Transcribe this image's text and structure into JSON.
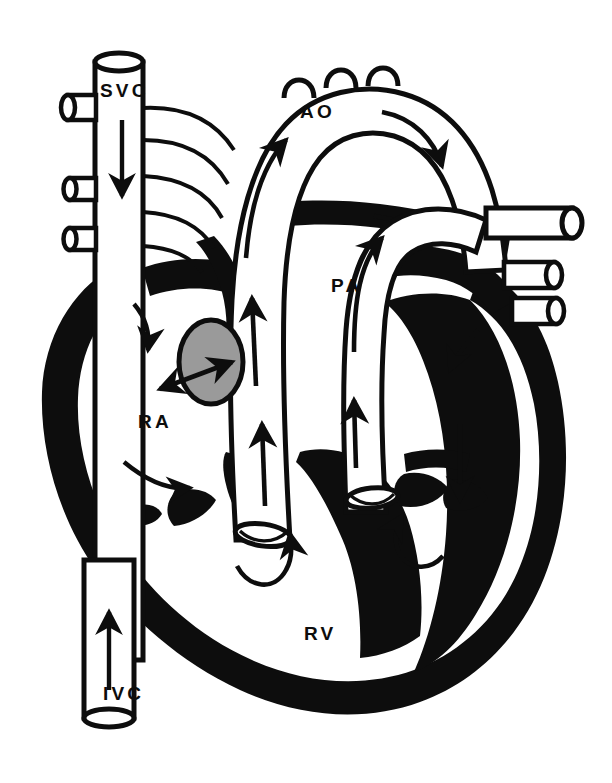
{
  "figure": {
    "kind": "anatomical-line-diagram",
    "background_color": "#ffffff",
    "ink_color": "#0d0d0d",
    "accent_gray": "#9a9a9a",
    "width": 612,
    "height": 783
  },
  "labels": {
    "svc": "SVC",
    "ivc": "IVC",
    "ao": "AO",
    "pa": "PA",
    "ra": "RA",
    "rv": "RV",
    "la": "LA",
    "lv": "LV"
  },
  "label_positions": {
    "svc": {
      "x": 100,
      "y": 97
    },
    "ivc": {
      "x": 103,
      "y": 700
    },
    "ao": {
      "x": 300,
      "y": 118
    },
    "pa": {
      "x": 331,
      "y": 292
    },
    "ra": {
      "x": 138,
      "y": 428
    },
    "rv": {
      "x": 304,
      "y": 640
    },
    "la": {
      "x": 469,
      "y": 400
    },
    "lv": {
      "x": 466,
      "y": 590
    }
  },
  "structures": [
    {
      "id": "svc",
      "name": "superior-vena-cava",
      "label": "SVC",
      "flow": "down"
    },
    {
      "id": "ivc",
      "name": "inferior-vena-cava",
      "label": "IVC",
      "flow": "up"
    },
    {
      "id": "ao",
      "name": "aorta",
      "label": "AO",
      "flow": "arch-right"
    },
    {
      "id": "pa",
      "name": "pulmonary-artery",
      "label": "PA",
      "flow": "up"
    },
    {
      "id": "ra",
      "name": "right-atrium",
      "label": "RA",
      "flow": "swirl"
    },
    {
      "id": "rv",
      "name": "right-ventricle",
      "label": "RV",
      "flow": "up-out"
    },
    {
      "id": "la",
      "name": "left-atrium",
      "label": "LA",
      "flow": "down-in"
    },
    {
      "id": "lv",
      "name": "left-ventricle",
      "label": "LV",
      "flow": "up-out"
    },
    {
      "id": "foramen-ovale",
      "name": "foramen-ovale",
      "label": "",
      "flow": "bidirectional"
    }
  ],
  "vessel_stubs": {
    "svc_tributaries": 3,
    "aortic_arch_branches": 3,
    "pulmonary_veins_right": 3
  },
  "caption": {
    "text": ""
  }
}
